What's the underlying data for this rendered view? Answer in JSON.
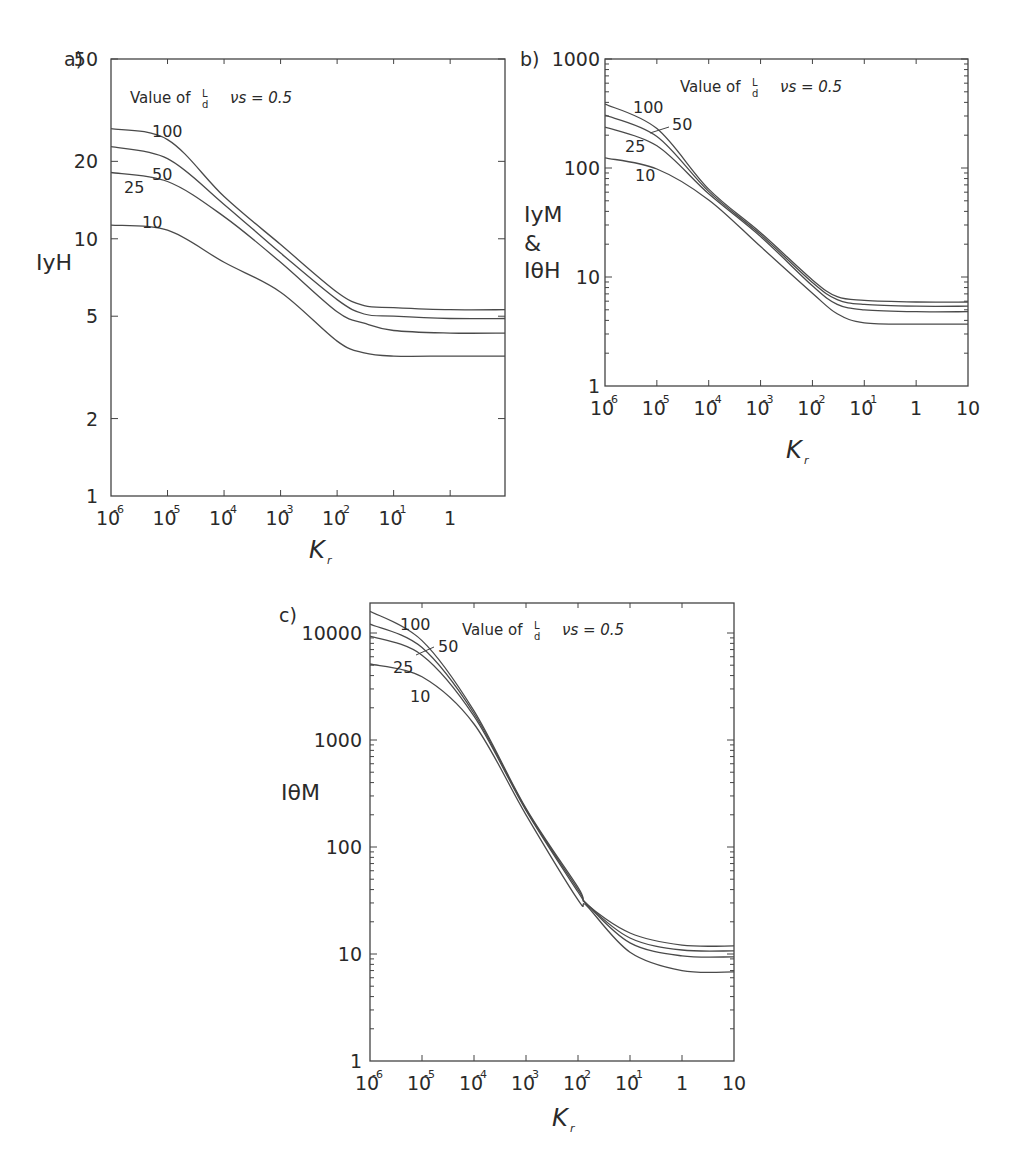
{
  "figure": {
    "legend_text": "Value of",
    "legend_frac_num": "L",
    "legend_frac_den": "d",
    "legend_param": "νs = 0.5"
  },
  "chart_data": [
    {
      "id": "a",
      "type": "line",
      "panel_label": "a)",
      "title": "",
      "xlabel": "K",
      "xlabel_sub": "r",
      "ylabel_lines": [
        "IyH"
      ],
      "xscale": "log",
      "yscale": "log",
      "xlim": [
        1e-06,
        10
      ],
      "ylim": [
        1,
        50
      ],
      "x_ticks": [
        {
          "base": "10",
          "exp": "-6"
        },
        {
          "base": "10",
          "exp": "-5"
        },
        {
          "base": "10",
          "exp": "-4"
        },
        {
          "base": "10",
          "exp": "-3"
        },
        {
          "base": "10",
          "exp": "-2"
        },
        {
          "base": "10",
          "exp": "-1"
        },
        {
          "base": "1",
          "exp": ""
        }
      ],
      "y_ticks": [
        "1",
        "2",
        "5",
        "10",
        "20",
        "50"
      ],
      "grid": false,
      "legend": "Value of L/d  νs = 0.5",
      "x": [
        1e-06,
        1e-05,
        0.0001,
        0.001,
        0.01,
        0.03,
        0.1,
        1,
        10
      ],
      "series": [
        {
          "name": "100",
          "values": [
            26.8,
            24.3,
            14.6,
            9.5,
            6.2,
            5.5,
            5.4,
            5.3,
            5.3
          ]
        },
        {
          "name": "50",
          "values": [
            22.8,
            20.5,
            13.6,
            8.8,
            5.8,
            5.1,
            5.0,
            4.9,
            4.9
          ]
        },
        {
          "name": "25",
          "values": [
            18.1,
            16.7,
            12.2,
            8.1,
            5.2,
            4.7,
            4.4,
            4.3,
            4.3
          ]
        },
        {
          "name": "10",
          "values": [
            11.3,
            10.8,
            8.1,
            6.2,
            4.0,
            3.6,
            3.5,
            3.5,
            3.5
          ]
        }
      ]
    },
    {
      "id": "b",
      "type": "line",
      "panel_label": "b)",
      "title": "",
      "xlabel": "K",
      "xlabel_sub": "r",
      "ylabel_lines": [
        "IyM",
        "&",
        "IθH"
      ],
      "xscale": "log",
      "yscale": "log",
      "xlim": [
        1e-06,
        10
      ],
      "ylim": [
        1,
        1000
      ],
      "x_ticks": [
        {
          "base": "10",
          "exp": "-6"
        },
        {
          "base": "10",
          "exp": "-5"
        },
        {
          "base": "10",
          "exp": "-4"
        },
        {
          "base": "10",
          "exp": "-3"
        },
        {
          "base": "10",
          "exp": "-2"
        },
        {
          "base": "10",
          "exp": "-1"
        },
        {
          "base": "1",
          "exp": ""
        },
        {
          "base": "10",
          "exp": ""
        }
      ],
      "y_ticks": [
        "1",
        "10",
        "100",
        "1000"
      ],
      "grid": false,
      "legend": "Value of L/d  νs = 0.5",
      "x": [
        1e-06,
        1e-05,
        0.0001,
        0.001,
        0.01,
        0.03,
        0.1,
        1,
        10
      ],
      "series": [
        {
          "name": "100",
          "values": [
            386,
            230,
            64,
            25.5,
            9.4,
            6.6,
            6.1,
            5.9,
            5.9
          ]
        },
        {
          "name": "50",
          "values": [
            306,
            195,
            61,
            24.5,
            8.9,
            6.2,
            5.6,
            5.4,
            5.4
          ]
        },
        {
          "name": "25",
          "values": [
            238,
            160,
            58,
            23.5,
            8.3,
            5.6,
            5.0,
            4.8,
            4.8
          ]
        },
        {
          "name": "10",
          "values": [
            124,
            98,
            51,
            19,
            7.1,
            4.6,
            3.8,
            3.7,
            3.7
          ]
        }
      ]
    },
    {
      "id": "c",
      "type": "line",
      "panel_label": "c)",
      "title": "",
      "xlabel": "K",
      "xlabel_sub": "r",
      "ylabel_lines": [
        "IθM"
      ],
      "xscale": "log",
      "yscale": "log",
      "xlim": [
        1e-06,
        10
      ],
      "ylim": [
        1,
        20000
      ],
      "x_ticks": [
        {
          "base": "10",
          "exp": "-6"
        },
        {
          "base": "10",
          "exp": "-5"
        },
        {
          "base": "10",
          "exp": "-4"
        },
        {
          "base": "10",
          "exp": "-3"
        },
        {
          "base": "10",
          "exp": "-2"
        },
        {
          "base": "10",
          "exp": "-1"
        },
        {
          "base": "1",
          "exp": ""
        },
        {
          "base": "10",
          "exp": ""
        }
      ],
      "y_ticks": [
        "1",
        "10",
        "100",
        "1000",
        "10000"
      ],
      "grid": false,
      "legend": "Value of L/d  νs = 0.5",
      "x": [
        1e-06,
        1e-05,
        0.0001,
        0.001,
        0.015,
        0.01,
        0.1,
        1,
        10
      ],
      "series": [
        {
          "name": "100",
          "values": [
            16000,
            8500,
            1870,
            230,
            29,
            42,
            15.7,
            12.1,
            11.9
          ]
        },
        {
          "name": "50",
          "values": [
            12100,
            7300,
            1770,
            225,
            29,
            40,
            14.1,
            10.9,
            10.7
          ]
        },
        {
          "name": "25",
          "values": [
            9380,
            6200,
            1670,
            220,
            29,
            38,
            12.7,
            9.6,
            9.4
          ]
        },
        {
          "name": "10",
          "values": [
            5130,
            3900,
            1410,
            200,
            28,
            32,
            10.4,
            7.0,
            6.8
          ]
        }
      ]
    }
  ]
}
